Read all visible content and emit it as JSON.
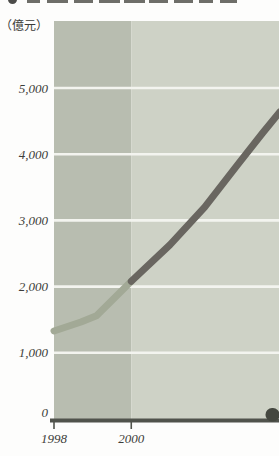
{
  "header": {
    "title_legible": false
  },
  "chart_data": {
    "type": "line",
    "title": "",
    "unit_label": "（億元）",
    "xlabel": "",
    "ylabel": "",
    "x_ticks": [
      {
        "label": "1998",
        "value": 1998
      },
      {
        "label": "2000",
        "value": 2000
      }
    ],
    "y_ticks": [
      {
        "label": "0",
        "value": 0
      },
      {
        "label": "1,000",
        "value": 1000
      },
      {
        "label": "2,000",
        "value": 2000
      },
      {
        "label": "3,000",
        "value": 3000
      },
      {
        "label": "4,000",
        "value": 4000
      },
      {
        "label": "5,000",
        "value": 5000
      }
    ],
    "xlim": [
      1998,
      2003.85
    ],
    "ylim": [
      0,
      6000
    ],
    "grid": {
      "horizontal": true,
      "color": "#f3f4ef"
    },
    "plot_bands": [
      {
        "from": 1998,
        "to": 2000,
        "color": "#b8bdb0"
      },
      {
        "from": 2000,
        "to": 2003.85,
        "color": "#ced2c6"
      }
    ],
    "series": [
      {
        "name": "segment-1998-2000",
        "color": "#a2a996",
        "points": [
          [
            1998,
            1330
          ],
          [
            1998.7,
            1465
          ],
          [
            1999.1,
            1560
          ],
          [
            2000,
            2080
          ]
        ]
      },
      {
        "name": "segment-2000-onward",
        "color": "#696660",
        "points": [
          [
            2000,
            2080
          ],
          [
            2001,
            2630
          ],
          [
            2001.9,
            3200
          ],
          [
            2002.75,
            3840
          ],
          [
            2003.4,
            4320
          ],
          [
            2003.85,
            4640
          ]
        ]
      }
    ],
    "axis_color": "#50534c",
    "label_color": "#3d3e3a",
    "legend": "none"
  }
}
